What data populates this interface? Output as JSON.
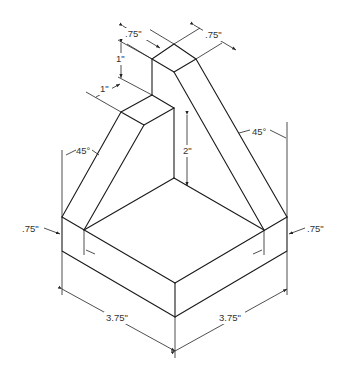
{
  "drawing": {
    "type": "isometric technical drawing",
    "labels": {
      "top_left_width": ".75\"",
      "top_right_width": ".75\"",
      "upright_height": "1\"",
      "step_depth": "1\"",
      "left_angle": "45°",
      "right_angle": "45°",
      "inner_height": "2\"",
      "left_base_thickness": ".75\"",
      "right_base_thickness": ".75\"",
      "left_base_length": "3.75\"",
      "right_base_length": "3.75\""
    },
    "colors": {
      "line": "#1a1a1a",
      "background": "#ffffff"
    }
  }
}
